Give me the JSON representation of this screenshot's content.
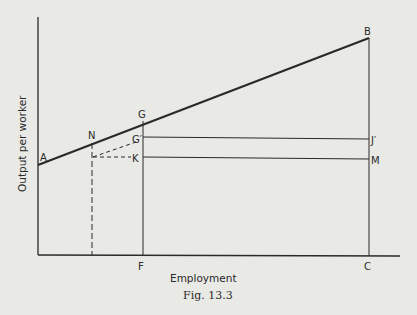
{
  "figure": {
    "caption": "Fig. 13.3",
    "x_axis_label": "Employment",
    "y_axis_label": "Output per worker",
    "background": "#e9e9e6",
    "ink": "#2a2a2a"
  },
  "points": {
    "A": "A",
    "B": "B",
    "G": "G",
    "G_prime": "G′",
    "N": "N",
    "K": "K",
    "J_prime": "J′",
    "M": "M",
    "F": "F",
    "C": "C"
  },
  "lines": {
    "AB": "output-per-worker line from A to B",
    "GF": "vertical from G to F",
    "BC": "vertical from B to C",
    "G_prime_J_prime": "horizontal from G′ to J′",
    "K_M": "horizontal from K to M",
    "N_dashed_vertical": "dashed vertical from N down to axis",
    "N_G_prime_dashed": "dashed line from N-foot to G′",
    "N_K_dashed": "dashed horizontal to K"
  }
}
